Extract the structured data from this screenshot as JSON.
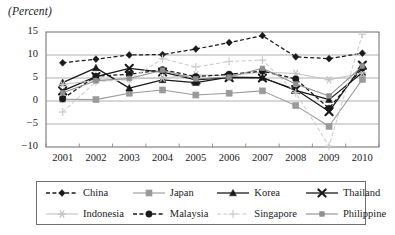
{
  "axis_title": "(Percent)",
  "legend": {
    "entries": [
      {
        "name": "China",
        "color": "#1a1a1a",
        "marker": "diamond",
        "dash": "dashed"
      },
      {
        "name": "Japan",
        "color": "#9a9a9a",
        "marker": "square",
        "dash": "solid"
      },
      {
        "name": "Korea",
        "color": "#1a1a1a",
        "marker": "triangle",
        "dash": "solid"
      },
      {
        "name": "Thailand",
        "color": "#1a1a1a",
        "marker": "x",
        "dash": "solid"
      },
      {
        "name": "Indonesia",
        "color": "#c2c2c2",
        "marker": "star",
        "dash": "solid"
      },
      {
        "name": "Malaysia",
        "color": "#1a1a1a",
        "marker": "circle",
        "dash": "dashed"
      },
      {
        "name": "Singapore",
        "color": "#cccccc",
        "marker": "plus",
        "dash": "dashed"
      },
      {
        "name": "Philippine",
        "color": "#8f8f8f",
        "marker": "minisquare",
        "dash": "solid"
      }
    ]
  },
  "chart_data": {
    "type": "line",
    "title": "",
    "xlabel": "",
    "ylabel": "(Percent)",
    "ylim": [
      -10,
      15
    ],
    "yticks": [
      15,
      10,
      5,
      0,
      -5,
      -10
    ],
    "grid": true,
    "legend_position": "bottom",
    "categories": [
      "2001",
      "2002",
      "2003",
      "2004",
      "2005",
      "2006",
      "2007",
      "2008",
      "2009",
      "2010"
    ],
    "series": [
      {
        "name": "China",
        "color": "#1a1a1a",
        "marker": "diamond",
        "dash": "dashed",
        "values": [
          8.3,
          9.1,
          10.0,
          10.1,
          11.3,
          12.7,
          14.2,
          9.6,
          9.2,
          10.4
        ]
      },
      {
        "name": "Japan",
        "color": "#9a9a9a",
        "marker": "square",
        "dash": "solid",
        "values": [
          0.4,
          0.3,
          1.7,
          2.4,
          1.3,
          1.7,
          2.2,
          -1.0,
          -5.5,
          4.7
        ]
      },
      {
        "name": "Korea",
        "color": "#1a1a1a",
        "marker": "triangle",
        "dash": "solid",
        "values": [
          4.0,
          7.2,
          2.8,
          4.6,
          4.0,
          5.2,
          5.1,
          2.3,
          0.3,
          6.2
        ]
      },
      {
        "name": "Thailand",
        "color": "#1a1a1a",
        "marker": "x",
        "dash": "solid",
        "values": [
          2.2,
          5.3,
          7.1,
          6.3,
          4.6,
          5.1,
          5.0,
          2.5,
          -2.3,
          7.8
        ]
      },
      {
        "name": "Indonesia",
        "color": "#c2c2c2",
        "marker": "star",
        "dash": "solid",
        "values": [
          3.6,
          4.5,
          4.8,
          5.0,
          5.7,
          5.5,
          6.3,
          6.0,
          4.6,
          6.1
        ]
      },
      {
        "name": "Malaysia",
        "color": "#1a1a1a",
        "marker": "circle",
        "dash": "dashed",
        "values": [
          0.5,
          5.4,
          5.8,
          6.8,
          5.3,
          5.8,
          6.5,
          4.8,
          -1.6,
          7.2
        ]
      },
      {
        "name": "Singapore",
        "color": "#cccccc",
        "marker": "plus",
        "dash": "dashed",
        "values": [
          -2.4,
          4.2,
          4.6,
          9.2,
          7.4,
          8.6,
          8.9,
          1.8,
          -9.8,
          14.5
        ]
      },
      {
        "name": "Philippine",
        "color": "#8f8f8f",
        "marker": "minisquare",
        "dash": "solid",
        "values": [
          1.8,
          4.4,
          4.9,
          6.7,
          4.8,
          5.2,
          7.1,
          3.7,
          1.1,
          7.6
        ]
      }
    ]
  }
}
